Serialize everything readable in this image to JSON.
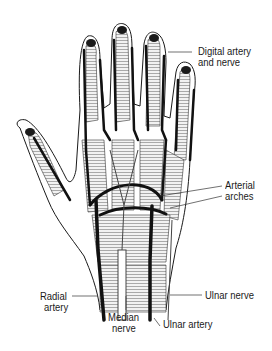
{
  "figure": {
    "labels": {
      "digital": {
        "line1": "Digital artery",
        "line2": "and nerve"
      },
      "arches": {
        "line1": "Arterial",
        "line2": "arches"
      },
      "radial": {
        "line1": "Radial",
        "line2": "artery"
      },
      "median": {
        "line1": "Median",
        "line2": "nerve"
      },
      "ulnar_nerve": "Ulnar nerve",
      "ulnar_artery": "Ulnar artery"
    },
    "colors": {
      "ink": "#1a1a1a",
      "tissue": "#d9d9d9",
      "background": "#ffffff"
    }
  }
}
